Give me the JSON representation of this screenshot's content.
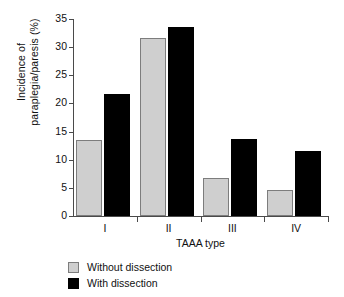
{
  "chart_data": {
    "type": "bar",
    "title": "",
    "subtitle": "",
    "xlabel": "TAAA type",
    "ylabel_lines": [
      "Incidence of",
      "paraplegia/paresis (%)"
    ],
    "ylabel": "Incidence of paraplegia/paresis (%)",
    "categories": [
      "I",
      "II",
      "III",
      "IV"
    ],
    "series": [
      {
        "name": "Without dissection",
        "color": "#cfcfcf",
        "edge_color": "#7d7d7d",
        "values": [
          13.5,
          31.6,
          6.7,
          4.7
        ]
      },
      {
        "name": "With dissection",
        "color": "#000000",
        "edge_color": "#000000",
        "values": [
          21.7,
          33.6,
          13.7,
          11.6
        ]
      }
    ],
    "ylim": [
      0,
      35
    ],
    "yticks": [
      0,
      5,
      10,
      15,
      20,
      25,
      30,
      35
    ],
    "ytick_labels": [
      "0",
      "5",
      "10",
      "15",
      "20",
      "25",
      "30",
      "35"
    ],
    "xtick_labels": [
      "I",
      "II",
      "III",
      "IV"
    ],
    "grid": false,
    "legend_position": "below-left",
    "legend": [
      {
        "label": "Without dissection",
        "swatch": "gray"
      },
      {
        "label": "With dissection",
        "swatch": "black"
      }
    ]
  }
}
